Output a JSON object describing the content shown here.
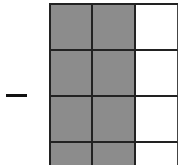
{
  "figure": {
    "operator_symbol": "−",
    "grid": {
      "columns": 3,
      "rows_visible": 4,
      "shaded_color": "#8c8c8c",
      "unshaded_color": "#ffffff",
      "line_color": "#222222",
      "cells": [
        [
          true,
          true,
          false
        ],
        [
          true,
          true,
          false
        ],
        [
          true,
          true,
          false
        ],
        [
          true,
          true,
          false
        ]
      ]
    }
  }
}
